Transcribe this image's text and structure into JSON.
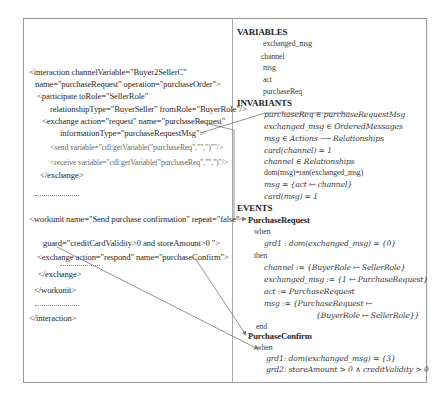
{
  "left": {
    "lines": [
      "<interaction channelVariable=\"Buyer2SellerC\"",
      "name=\"purchaseRequest\" operation=\"purchaseOrder\">",
      "<participate toRole=\"SellerRole\"",
      "relationshipType=\"BuyerSeller\" fromRole=\"BuyerRole\"/>",
      "<exchange action=\"request\" name=\"purchaseRequest\"",
      "informationType=\"purchaseRequestMsg\">",
      "<send variable=\"cdl:getVariable(\"purchaseReq\",\"\",\")\"\"/>",
      "<receive variable=\"cdl:getVariable(\"purchaseReq\",\"\",\")\"/>",
      "</exchange>",
      "<workunit name=\"Send purchase confirmation\" repeat=\"false\"",
      "guard=\"creditCardValidity>0 and storeAmount>0 \">",
      "<exchange action=\"respond\" name=\"purchaseConfirm\">",
      "</exchange>",
      "</workunit>",
      "</interaction>"
    ]
  },
  "right": {
    "variables_heading": "VARIABLES",
    "variables": [
      "exchanged_msg",
      "channel",
      "msg",
      "act",
      "purchaseReq"
    ],
    "invariants_heading": "INVARIANTS",
    "invariants": [
      "purchaseReq ∈ purchaseRequestMsg",
      "exchanged_msg ∈ OrderedMessages",
      "msg ∈ Actions ⟶ Relationships",
      "card(channel) = 1",
      "channel ∈ Relationships",
      "dom(msg)=ran(exchanged_msg)",
      "msg = {act ↦ channel}",
      "card(msg) = 1"
    ],
    "events_heading": "EVENTS",
    "events": [
      {
        "name": "PurchaseRequest",
        "when": "when",
        "guards": [
          "grd1 : dom(exchanged_msg) = {0}"
        ],
        "then": "then",
        "actions": [
          "channel := {BuyerRole ↦ SellerRole}",
          "exchanged_msg := {1 ↦ PurchaseRequest}",
          "act := PurchaseRequest",
          "msg := {PurchaseRequest ↦",
          "{BuyerRole ↦ SellerRole}}"
        ],
        "end": "end"
      },
      {
        "name": "PurchaseConfirm",
        "when": "when",
        "guards": [
          "grd1: dom(exchanged_msg) = {3}",
          "grd2: storeAmount > 0 ∧ creditValidity > 0"
        ],
        "then": "then",
        "actions": [],
        "end": "end"
      }
    ]
  },
  "colors": {
    "border": "#9a9a9a",
    "text": "#2a2a2a",
    "connector": "#7a7a7a"
  }
}
